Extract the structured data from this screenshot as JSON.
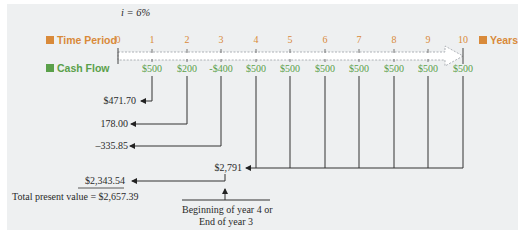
{
  "interest_rate": "i = 6%",
  "legend": {
    "time_period_label": "Time Period",
    "cash_flow_label": "Cash Flow",
    "years_label": "Years",
    "time_color": "#d98a3a",
    "cash_color": "#5aa04a"
  },
  "periods": [
    "0",
    "1",
    "2",
    "3",
    "4",
    "5",
    "6",
    "7",
    "8",
    "9",
    "10"
  ],
  "cash_flows": [
    "",
    "$500",
    "$200",
    "-$400",
    "$500",
    "$500",
    "$500",
    "$500",
    "$500",
    "$500",
    "$500"
  ],
  "present_values": {
    "pv1": "$471.70",
    "pv2": "178.00",
    "pv3": "–335.85",
    "annuity_value": "$2,791",
    "annuity_pv": "$2,343.54",
    "total": "Total present value = $2,657.39"
  },
  "annotation": {
    "line1": "Beginning of year 4 or",
    "line2": "End of year 3"
  }
}
